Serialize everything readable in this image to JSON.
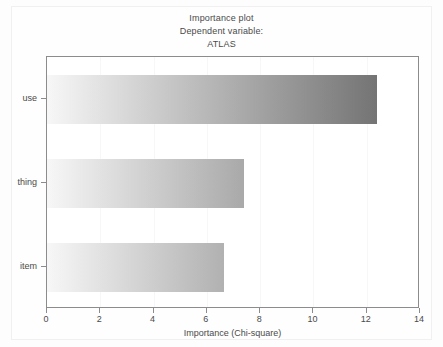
{
  "figure": {
    "title_lines": [
      "Importance plot",
      "Dependent variable:",
      "ATLAS"
    ],
    "background_color": "#fdfdfd",
    "frame_color": "#8c8c8c"
  },
  "chart_data": {
    "type": "bar",
    "orientation": "horizontal",
    "title": "Importance plot",
    "subtitle": "Dependent variable:",
    "dependent_variable": "ATLAS",
    "categories": [
      "use",
      "thing",
      "item"
    ],
    "values": [
      12.4,
      7.4,
      6.65
    ],
    "xlabel": "Importance (Chi-square)",
    "ylabel": "",
    "xlim": [
      0,
      14
    ],
    "xticks": [
      0,
      2,
      4,
      6,
      8,
      10,
      12,
      14
    ],
    "xticklabels": [
      "0",
      "2",
      "4",
      "6",
      "8",
      "10",
      "12",
      "14"
    ],
    "grid": "vertical",
    "legend": "none",
    "bar_fill": "gradient-grayscale",
    "gradient_start_color": "#f7f7f7",
    "gradient_end_color": "#636363"
  },
  "axis": {
    "x_title": "Importance (Chi-square)"
  }
}
